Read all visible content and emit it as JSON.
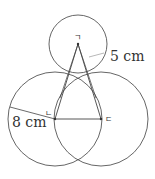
{
  "diagram": {
    "type": "geometry-circles",
    "points": {
      "top": {
        "label": "ㄱ",
        "x": 78,
        "y": 44
      },
      "left": {
        "label": "ㄴ",
        "x": 55,
        "y": 119
      },
      "right": {
        "label": "ㄷ",
        "x": 101,
        "y": 119
      }
    },
    "circles": [
      {
        "name": "top-circle",
        "cx": 78,
        "cy": 44,
        "r": 29,
        "radius_label": "5 cm"
      },
      {
        "name": "left-circle",
        "cx": 55,
        "cy": 119,
        "r": 47,
        "radius_label": "8 cm"
      },
      {
        "name": "right-circle",
        "cx": 101,
        "cy": 119,
        "r": 47
      }
    ],
    "labels": {
      "top_radius": "5 cm",
      "left_radius": "8 cm",
      "point_top": "ㄱ",
      "point_left": "ㄴ",
      "point_right": "ㄷ"
    },
    "stroke_color": "#555555"
  }
}
